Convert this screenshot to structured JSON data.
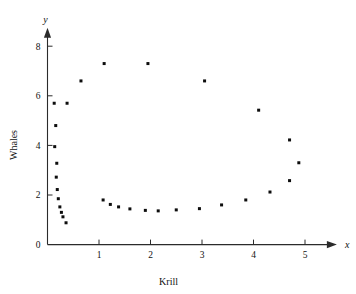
{
  "chart_data": {
    "type": "scatter",
    "title": "",
    "xlabel": "Krill",
    "ylabel": "Whales",
    "x_axis_variable": "x",
    "y_axis_variable": "y",
    "xlim": [
      0,
      5.6
    ],
    "ylim": [
      0,
      8.7
    ],
    "xticks": [
      1,
      2,
      3,
      4,
      5
    ],
    "xtick_labels": [
      "1",
      "2",
      "3",
      "4",
      "5"
    ],
    "yticks": [
      0,
      2,
      4,
      6,
      8
    ],
    "ytick_labels": [
      "0",
      "2",
      "4",
      "6",
      "8"
    ],
    "grid": false,
    "legend": false,
    "origin_label": "0",
    "points": [
      {
        "x": 0.13,
        "y": 5.7
      },
      {
        "x": 0.16,
        "y": 4.8
      },
      {
        "x": 0.14,
        "y": 3.95
      },
      {
        "x": 0.18,
        "y": 3.28
      },
      {
        "x": 0.17,
        "y": 2.72
      },
      {
        "x": 0.19,
        "y": 2.22
      },
      {
        "x": 0.21,
        "y": 1.85
      },
      {
        "x": 0.24,
        "y": 1.52
      },
      {
        "x": 0.27,
        "y": 1.3
      },
      {
        "x": 0.3,
        "y": 1.12
      },
      {
        "x": 0.36,
        "y": 0.88
      },
      {
        "x": 0.38,
        "y": 5.7
      },
      {
        "x": 0.65,
        "y": 6.6
      },
      {
        "x": 1.1,
        "y": 7.3
      },
      {
        "x": 1.95,
        "y": 7.3
      },
      {
        "x": 3.05,
        "y": 6.6
      },
      {
        "x": 4.1,
        "y": 5.42
      },
      {
        "x": 4.7,
        "y": 4.22
      },
      {
        "x": 4.88,
        "y": 3.3
      },
      {
        "x": 4.7,
        "y": 2.58
      },
      {
        "x": 4.32,
        "y": 2.12
      },
      {
        "x": 3.85,
        "y": 1.8
      },
      {
        "x": 3.38,
        "y": 1.6
      },
      {
        "x": 2.95,
        "y": 1.45
      },
      {
        "x": 2.5,
        "y": 1.4
      },
      {
        "x": 2.15,
        "y": 1.36
      },
      {
        "x": 1.9,
        "y": 1.38
      },
      {
        "x": 1.6,
        "y": 1.44
      },
      {
        "x": 1.38,
        "y": 1.52
      },
      {
        "x": 1.22,
        "y": 1.62
      },
      {
        "x": 1.08,
        "y": 1.8
      }
    ]
  },
  "axis": {
    "x_arrow_label": "x",
    "y_arrow_label": "y",
    "x_name": "Krill",
    "y_name": "Whales"
  }
}
